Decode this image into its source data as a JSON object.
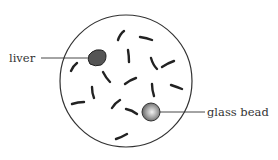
{
  "diagram": {
    "labels": {
      "liver": "liver",
      "glass_bead": "glass bead"
    },
    "colors": {
      "outline": "#333333",
      "liver_fill": "#555555",
      "bead_light": "#eeeeee",
      "bead_dark": "#666666",
      "strokes": "#222222"
    }
  }
}
